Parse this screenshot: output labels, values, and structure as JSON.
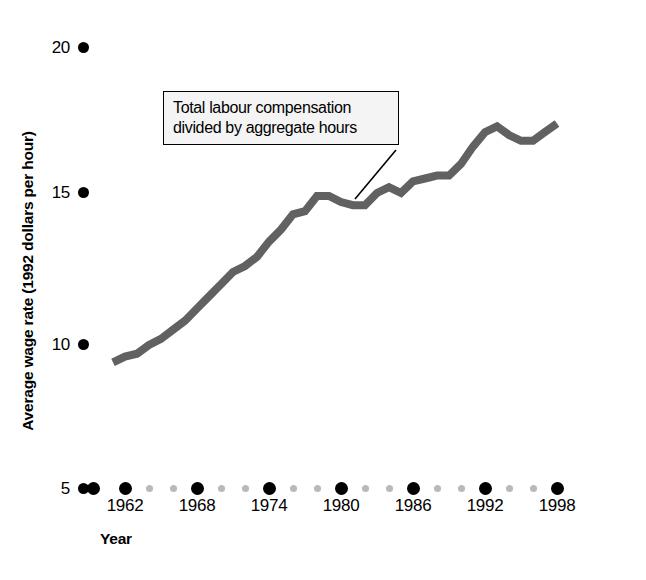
{
  "chart_data": {
    "type": "line",
    "title": "",
    "xlabel": "Year",
    "ylabel": "Average wage rate (1992 dollars per hour)",
    "annotation": {
      "line1": "Total labour compensation",
      "line2": "divided by aggregate hours"
    },
    "xlim": [
      1961,
      1999
    ],
    "ylim": [
      5,
      20
    ],
    "yticks": [
      "20",
      "15",
      "10",
      "5"
    ],
    "ytick_values": [
      20,
      15,
      10,
      5
    ],
    "xticks": [
      "1962",
      "1968",
      "1974",
      "1980",
      "1986",
      "1992",
      "1998"
    ],
    "xtick_values": [
      1962,
      1968,
      1974,
      1980,
      1986,
      1992,
      1998
    ],
    "grid": false,
    "legend": null,
    "series": [
      {
        "name": "Average wage rate",
        "color": "#616161",
        "x": [
          1961,
          1962,
          1963,
          1964,
          1965,
          1966,
          1967,
          1968,
          1969,
          1970,
          1971,
          1972,
          1973,
          1974,
          1975,
          1976,
          1977,
          1978,
          1979,
          1980,
          1981,
          1982,
          1983,
          1984,
          1985,
          1986,
          1987,
          1988,
          1989,
          1990,
          1991,
          1992,
          1993,
          1994,
          1995,
          1996,
          1997,
          1998
        ],
        "values": [
          9.4,
          9.6,
          9.7,
          10.0,
          10.2,
          10.5,
          10.8,
          11.2,
          11.6,
          12.0,
          12.4,
          12.6,
          12.9,
          13.4,
          13.8,
          14.3,
          14.4,
          14.9,
          14.9,
          14.7,
          14.6,
          14.6,
          15.0,
          15.2,
          15.0,
          15.4,
          15.5,
          15.6,
          15.6,
          16.0,
          16.6,
          17.1,
          17.3,
          17.0,
          16.8,
          16.8,
          17.1,
          17.4
        ]
      }
    ]
  },
  "axes": {
    "ylabel": "Average wage rate (1992 dollars per hour)",
    "xlabel": "Year",
    "yticks": [
      "20",
      "15",
      "10",
      "5"
    ],
    "xticks": [
      "1962",
      "1968",
      "1974",
      "1980",
      "1986",
      "1992",
      "1998"
    ]
  },
  "annotation": {
    "line1": "Total labour compensation",
    "line2": "divided by aggregate hours"
  },
  "colors": {
    "line": "#616161",
    "text": "#000000",
    "tick_major": "#000000",
    "tick_minor": "#b9b9b9",
    "annotation_bg": "#f4f4f4",
    "background": "#ffffff"
  }
}
